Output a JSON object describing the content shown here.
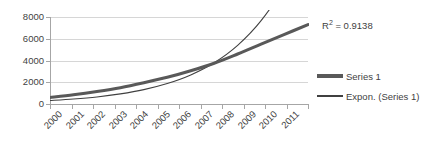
{
  "chart_data": {
    "type": "line",
    "title": "",
    "xlabel": "",
    "ylabel": "",
    "categories": [
      "2000",
      "2001",
      "2002",
      "2003",
      "2004",
      "2005",
      "2006",
      "2007",
      "2008",
      "2009",
      "2010",
      "2011"
    ],
    "ylim": [
      0,
      8000
    ],
    "y_ticks": [
      0,
      2000,
      4000,
      6000,
      8000
    ],
    "grid": true,
    "legend_position": "right",
    "series": [
      {
        "name": "Series 1",
        "style": "thick-line",
        "color": "#595959",
        "values": [
          600,
          850,
          1150,
          1500,
          1950,
          2450,
          3050,
          3750,
          4600,
          5500,
          6400,
          7300
        ]
      },
      {
        "name": "Expon. (Series 1)",
        "style": "thin-line",
        "color": "#404040",
        "values": [
          320,
          460,
          650,
          930,
          1320,
          1880,
          2670,
          3790,
          5390,
          7660,
          10890,
          15480
        ]
      }
    ],
    "annotations": [
      {
        "name": "r-squared",
        "prefix": "R",
        "superscript": "2",
        "text": " = 0.9138",
        "full": "R² = 0.9138"
      }
    ],
    "legend": [
      {
        "label": "Series 1",
        "swatch": "thick"
      },
      {
        "label": "Expon. (Series 1)",
        "swatch": "thin"
      }
    ],
    "colors": {
      "series": "#595959",
      "trendline": "#404040",
      "gridline": "#d6d6d6",
      "axis": "#a6a6a6",
      "text": "#3f3f3f",
      "background": "#ffffff"
    }
  }
}
